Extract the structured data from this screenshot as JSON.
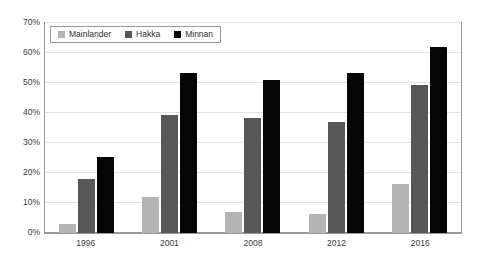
{
  "chart_data": {
    "type": "bar",
    "title": "",
    "xlabel": "",
    "ylabel": "",
    "categories": [
      "1996",
      "2001",
      "2008",
      "2012",
      "2016"
    ],
    "series": [
      {
        "name": "Mainlander",
        "color": "#b4b4b4",
        "values": [
          3,
          12,
          7,
          6.5,
          16.5
        ]
      },
      {
        "name": "Hakka",
        "color": "#575757",
        "values": [
          18,
          39.5,
          38.5,
          37,
          49.5
        ]
      },
      {
        "name": "Minnan",
        "color": "#050505",
        "values": [
          25.5,
          53.5,
          51,
          53.5,
          62
        ]
      }
    ],
    "ylim": [
      0,
      70
    ],
    "ytick_values": [
      0,
      10,
      20,
      30,
      40,
      50,
      60,
      70
    ],
    "ytick_labels": [
      "0%",
      "10%",
      "20%",
      "30%",
      "40%",
      "50%",
      "60%",
      "70%"
    ],
    "grid": true,
    "legend_position": "top-left",
    "legend_entries": [
      "Mainlander",
      "Hakka",
      "Minnan"
    ]
  }
}
